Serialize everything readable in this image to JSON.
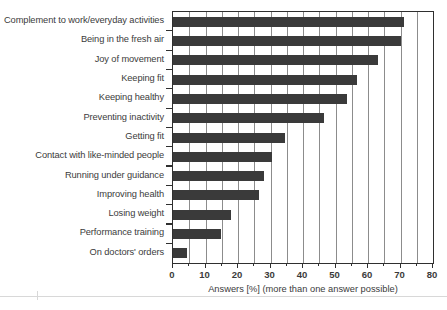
{
  "chart_data": {
    "type": "bar",
    "orientation": "horizontal",
    "title": "",
    "xlabel": "Answers [%] (more than one answer possible)",
    "ylabel": "",
    "xlim": [
      0,
      80
    ],
    "grid": "vertical major every 5",
    "legend": "none",
    "bar_color": "#3a3a3a",
    "axis_color": "#2f2f2f",
    "gridline_color": "#8c8c8c",
    "categories": [
      "Complement to work/everyday activities",
      "Being in the fresh air",
      "Joy of movement",
      "Keeping fit",
      "Keeping healthy",
      "Preventing inactivity",
      "Getting fit",
      "Contact with like-minded people",
      "Running under guidance",
      "Improving health",
      "Losing weight",
      "Performance training",
      "On doctors' orders"
    ],
    "values": [
      71,
      70,
      63,
      56.5,
      53.5,
      46.5,
      34.5,
      30.5,
      28,
      26.5,
      17.8,
      14.7,
      4.3
    ],
    "xticks": [
      0,
      10,
      20,
      30,
      40,
      50,
      60,
      70,
      80
    ],
    "xtick_labels": [
      "0",
      "10",
      "20",
      "30",
      "40",
      "50",
      "60",
      "70",
      "80"
    ],
    "minor_xticks": [
      5,
      15,
      25,
      35,
      45,
      55,
      65,
      75
    ],
    "gridline_positions": [
      5,
      10,
      15,
      20,
      25,
      30,
      35,
      40,
      45,
      50,
      55,
      60,
      65,
      70,
      75
    ]
  }
}
